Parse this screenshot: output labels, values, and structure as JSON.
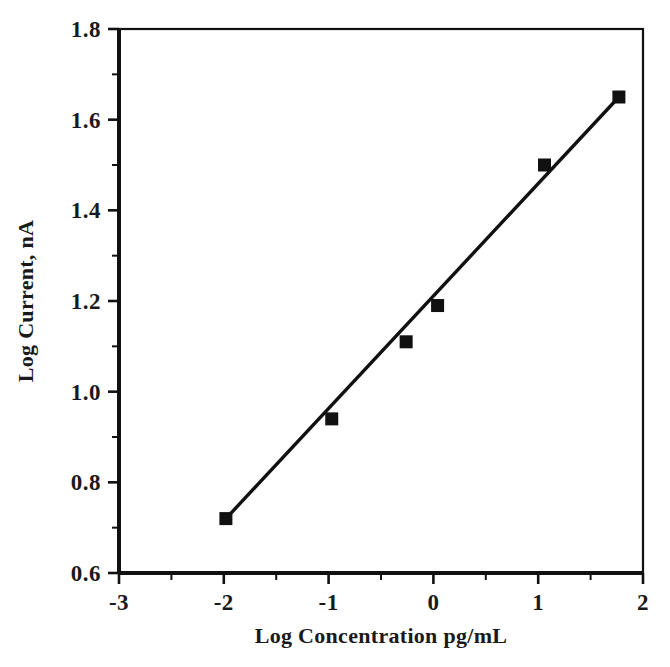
{
  "chart_data": {
    "type": "scatter",
    "title": "",
    "subtitle": "",
    "xlabel": "Log Concentration pg/mL",
    "ylabel": "Log Current, nA",
    "xlim": [
      -3,
      2
    ],
    "ylim": [
      0.6,
      1.8
    ],
    "x_major_ticks": [
      -3,
      -2,
      -1,
      0,
      1,
      2
    ],
    "x_tick_labels": [
      "-3",
      "-2",
      "-1",
      "0",
      "1",
      "2"
    ],
    "x_minor_step": 0.5,
    "y_major_ticks": [
      0.6,
      0.8,
      1.0,
      1.2,
      1.4,
      1.6,
      1.8
    ],
    "y_tick_labels": [
      "0.6",
      "0.8",
      "1.0",
      "1.2",
      "1.4",
      "1.6",
      "1.8"
    ],
    "y_minor_step": 0.1,
    "grid": false,
    "legend": false,
    "legend_position": "none",
    "marker": "filled-square",
    "marker_color": "#111111",
    "line_color": "#111111",
    "series": [
      {
        "name": "calibration",
        "x": [
          -1.98,
          -0.97,
          -0.26,
          0.04,
          1.06,
          1.77
        ],
        "y": [
          0.72,
          0.94,
          1.11,
          1.19,
          1.5,
          1.65
        ]
      }
    ],
    "fit_line": {
      "x": [
        -1.98,
        1.77
      ],
      "y": [
        0.72,
        1.65
      ]
    }
  },
  "colors": {
    "ink": "#111111",
    "background": "#ffffff"
  }
}
